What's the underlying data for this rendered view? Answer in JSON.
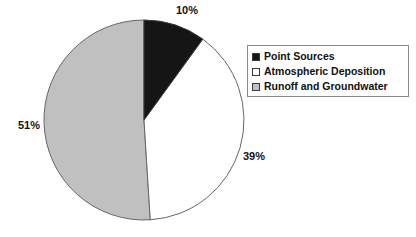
{
  "chart_data": {
    "type": "pie",
    "title": "",
    "labels": [
      "Point Sources",
      "Atmospheric Deposition",
      "Runoff and Groundwater"
    ],
    "values": [
      10,
      39,
      51
    ],
    "value_labels": [
      "10%",
      "39%",
      "51%"
    ],
    "colors": [
      "#151515",
      "#ffffff",
      "#c0c0c0"
    ],
    "slice_border_color": "#555555",
    "start_angle_deg": 0,
    "direction": "clockwise",
    "legend_position": "right",
    "grid": false,
    "xlabel": "",
    "ylabel": ""
  },
  "pie": {
    "center_x": 144,
    "center_y": 120,
    "radius": 100,
    "slices": [
      {
        "name": "point-sources",
        "label": "Point Sources",
        "percent": 10,
        "value_label": "10%",
        "color": "#151515"
      },
      {
        "name": "atmospheric-deposition",
        "label": "Atmospheric Deposition",
        "percent": 39,
        "value_label": "39%",
        "color": "#ffffff"
      },
      {
        "name": "runoff-and-groundwater",
        "label": "Runoff and Groundwater",
        "percent": 51,
        "value_label": "51%",
        "color": "#c0c0c0"
      }
    ]
  },
  "legend": {
    "items": [
      {
        "swatch": "black",
        "label": "Point Sources"
      },
      {
        "swatch": "white",
        "label": "Atmospheric Deposition"
      },
      {
        "swatch": "gray",
        "label": "Runoff and Groundwater"
      }
    ]
  }
}
